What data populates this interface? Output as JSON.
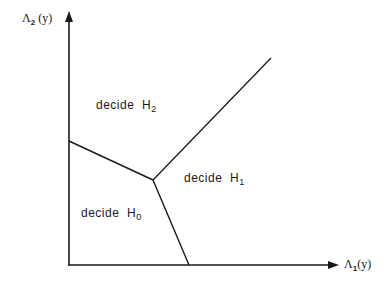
{
  "diagram": {
    "type": "decision-regions",
    "axes": {
      "x": {
        "symbol": "Λ",
        "subscript": "1",
        "suffix": "(y)"
      },
      "y": {
        "symbol": "Λ",
        "subscript": "2",
        "suffix": "(y)"
      }
    },
    "regions": [
      {
        "id": "H0",
        "prefix": "decide",
        "hyp": "H",
        "subscript": "0"
      },
      {
        "id": "H1",
        "prefix": "decide",
        "hyp": "H",
        "subscript": "1"
      },
      {
        "id": "H2",
        "prefix": "decide",
        "hyp": "H",
        "subscript": "2"
      }
    ],
    "colors": {
      "line": "#1a1a1a",
      "background": "#ffffff"
    },
    "geometry": {
      "origin": [
        69,
        265
      ],
      "y_axis_top": [
        69,
        12
      ],
      "x_axis_right": [
        338,
        265
      ],
      "junction": [
        153,
        180
      ],
      "boundary_H0_H2_start": [
        69,
        141
      ],
      "boundary_H0_H1_end": [
        189,
        265
      ],
      "boundary_H1_H2_end": [
        271,
        58
      ]
    }
  }
}
